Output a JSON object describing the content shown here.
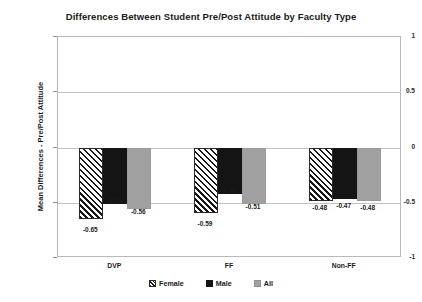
{
  "chart_data": {
    "type": "bar",
    "title": "Differences Between Student Pre/Post Attitude by Faculty Type",
    "xlabel": "",
    "ylabel": "Mean Differences - Pre/Post Attitude",
    "categories": [
      "DVP",
      "FF",
      "Non-FF"
    ],
    "series": [
      {
        "name": "Female",
        "values": [
          -0.65,
          -0.59,
          -0.48
        ],
        "labels": [
          "-0.65",
          "-0.59",
          "-0.48"
        ],
        "fill": "diagonal-hatch",
        "color": "#ffffff"
      },
      {
        "name": "Male",
        "values": [
          -0.51,
          -0.42,
          -0.47
        ],
        "labels": [
          "-0.51",
          "-0.42",
          "-0.47"
        ],
        "fill": "solid",
        "color": "#141414"
      },
      {
        "name": "All",
        "values": [
          -0.56,
          -0.51,
          -0.48
        ],
        "labels": [
          "-0.56",
          "-0.51",
          "-0.48"
        ],
        "fill": "solid",
        "color": "#a0a0a0"
      }
    ],
    "ylim": [
      -1,
      1
    ],
    "yticks": [
      1,
      0.5,
      0,
      -0.5,
      -1
    ],
    "ytick_labels": [
      "1",
      "0.5",
      "0",
      "-0.5",
      "-1"
    ],
    "grid": true,
    "legend_position": "bottom",
    "legend_entries": [
      "Female",
      "Male",
      "All"
    ]
  }
}
